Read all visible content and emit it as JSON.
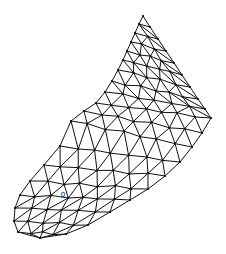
{
  "figure": {
    "type": "triangular-finite-element-mesh",
    "background": "#ffffff",
    "stroke_color": "#111111",
    "node_color": "#111111",
    "node_radius": 1.1
  },
  "hole_marker": {
    "x": 63,
    "y": 195,
    "label": "0"
  },
  "cross_sections": [
    {
      "inner": [
        143,
        16
      ],
      "outer": [
        143,
        16
      ],
      "n": 1
    },
    {
      "inner": [
        139,
        24
      ],
      "outer": [
        150,
        27
      ],
      "n": 2
    },
    {
      "inner": [
        135,
        33
      ],
      "outer": [
        158,
        39
      ],
      "n": 3
    },
    {
      "inner": [
        131,
        42
      ],
      "outer": [
        166,
        51
      ],
      "n": 4
    },
    {
      "inner": [
        127,
        51
      ],
      "outer": [
        174,
        63
      ],
      "n": 5
    },
    {
      "inner": [
        123,
        60
      ],
      "outer": [
        182,
        75
      ],
      "n": 6
    },
    {
      "inner": [
        118,
        70
      ],
      "outer": [
        190,
        87
      ],
      "n": 6
    },
    {
      "inner": [
        112,
        81
      ],
      "outer": [
        198,
        99
      ],
      "n": 7
    },
    {
      "inner": [
        105,
        92
      ],
      "outer": [
        205,
        109
      ],
      "n": 7
    },
    {
      "inner": [
        96,
        103
      ],
      "outer": [
        211,
        118
      ],
      "n": 8
    },
    {
      "inner": [
        84,
        111
      ],
      "outer": [
        202,
        133
      ],
      "n": 8
    },
    {
      "inner": [
        71,
        121
      ],
      "outer": [
        192,
        147
      ],
      "n": 8
    },
    {
      "inner": [
        60,
        146
      ],
      "outer": [
        180,
        162
      ],
      "n": 8
    },
    {
      "inner": [
        44,
        165
      ],
      "outer": [
        165,
        176
      ],
      "n": 8
    },
    {
      "inner": [
        30,
        181
      ],
      "outer": [
        148,
        189
      ],
      "n": 8
    },
    {
      "inner": [
        20,
        195
      ],
      "outer": [
        130,
        200
      ],
      "n": 8
    },
    {
      "inner": [
        15,
        208
      ],
      "outer": [
        110,
        212
      ],
      "n": 7
    },
    {
      "inner": [
        14,
        221
      ],
      "outer": [
        88,
        225
      ],
      "n": 6
    },
    {
      "inner": [
        18,
        232
      ],
      "outer": [
        66,
        234
      ],
      "n": 5
    },
    {
      "inner": [
        40,
        238
      ],
      "outer": [
        40,
        238
      ],
      "n": 1
    }
  ],
  "bulge": [
    0,
    1,
    1.5,
    2,
    2.5,
    3,
    3,
    3,
    3,
    3,
    4,
    5,
    5,
    5,
    4,
    3,
    3,
    2,
    1,
    0
  ]
}
